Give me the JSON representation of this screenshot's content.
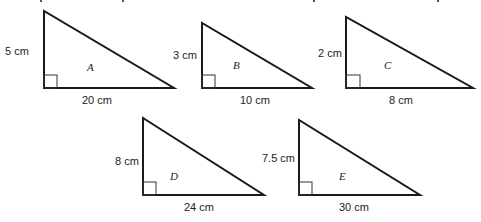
{
  "figure": {
    "triangles": [
      {
        "name": "A",
        "height_label": "5 cm",
        "base_label": "20 cm"
      },
      {
        "name": "B",
        "height_label": "3 cm",
        "base_label": "10 cm"
      },
      {
        "name": "C",
        "height_label": "2 cm",
        "base_label": "8 cm"
      },
      {
        "name": "D",
        "height_label": "8 cm",
        "base_label": "24 cm"
      },
      {
        "name": "E",
        "height_label": "7.5 cm",
        "base_label": "30 cm"
      }
    ],
    "line_color": "#1a1a1a",
    "background": "#ffffff"
  }
}
